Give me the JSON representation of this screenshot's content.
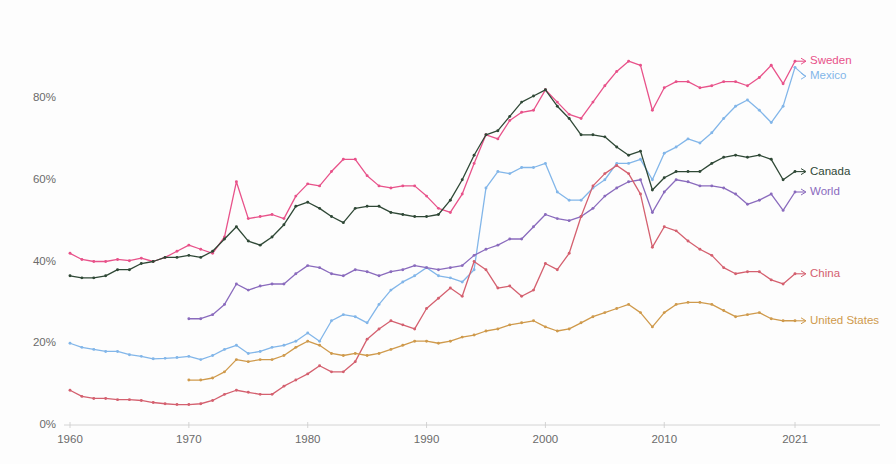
{
  "chart_data": {
    "type": "line",
    "title": "",
    "subtitle": "",
    "xlabel": "",
    "ylabel": "",
    "xlim": [
      1960,
      2021
    ],
    "ylim": [
      0,
      90
    ],
    "grid": false,
    "legend_position": "right-inline-labels",
    "y_ticks": [
      "0%",
      "20%",
      "40%",
      "60%",
      "80%"
    ],
    "y_tick_values": [
      0,
      20,
      40,
      60,
      80
    ],
    "x_ticks": [
      "1960",
      "1970",
      "1980",
      "1990",
      "2000",
      "2010",
      "2021"
    ],
    "x_tick_values": [
      1960,
      1970,
      1980,
      1990,
      2000,
      2010,
      2021
    ],
    "series": [
      {
        "name": "Sweden",
        "color": "#e8528a",
        "label_color": "#e8528a",
        "start_year": 1960,
        "values": [
          42.0,
          40.5,
          40.0,
          40.0,
          40.5,
          40.2,
          40.8,
          40.0,
          41.0,
          42.5,
          44.0,
          43.0,
          42.0,
          46.0,
          59.5,
          50.5,
          51.0,
          51.5,
          50.5,
          56.0,
          59.0,
          58.5,
          62.0,
          65.0,
          65.0,
          61.0,
          58.5,
          58.0,
          58.5,
          58.5,
          56.0,
          53.0,
          52.0,
          56.5,
          64.0,
          71.0,
          70.0,
          74.5,
          76.5,
          77.0,
          82.0,
          79.0,
          76.0,
          75.0,
          79.0,
          83.0,
          86.5,
          89.0,
          88.0,
          77.0,
          82.5,
          84.0,
          84.0,
          82.5,
          83.0,
          84.0,
          84.0,
          83.0,
          85.0,
          88.0,
          83.5,
          89.0
        ]
      },
      {
        "name": "Mexico",
        "color": "#82b6e9",
        "label_color": "#82b6e9",
        "start_year": 1960,
        "values": [
          20.0,
          19.0,
          18.5,
          18.0,
          18.0,
          17.2,
          16.8,
          16.2,
          16.3,
          16.5,
          16.8,
          16.0,
          17.0,
          18.5,
          19.5,
          17.5,
          18.0,
          19.0,
          19.5,
          20.5,
          22.5,
          20.5,
          25.5,
          27.0,
          26.5,
          25.0,
          29.5,
          33.0,
          35.0,
          36.5,
          38.5,
          36.5,
          36.0,
          35.0,
          38.0,
          58.0,
          62.0,
          61.5,
          63.0,
          63.0,
          64.0,
          57.0,
          55.0,
          55.0,
          58.0,
          60.0,
          64.0,
          64.0,
          65.0,
          60.0,
          66.5,
          68.0,
          70.0,
          69.0,
          71.5,
          75.0,
          78.0,
          79.5,
          77.0,
          74.0,
          78.0,
          87.5
        ]
      },
      {
        "name": "Canada",
        "color": "#2f4836",
        "label_color": "#2f4836",
        "start_year": 1960,
        "values": [
          36.5,
          36.0,
          36.0,
          36.5,
          38.0,
          38.0,
          39.5,
          40.0,
          41.0,
          41.0,
          41.5,
          41.0,
          42.5,
          45.5,
          48.5,
          45.0,
          44.0,
          46.0,
          49.0,
          53.5,
          54.5,
          53.0,
          51.0,
          49.5,
          53.0,
          53.5,
          53.5,
          52.0,
          51.5,
          51.0,
          51.0,
          51.5,
          55.0,
          60.0,
          66.0,
          71.0,
          72.0,
          75.5,
          79.0,
          80.5,
          82.0,
          78.0,
          75.0,
          71.0,
          71.0,
          70.5,
          68.0,
          66.0,
          67.0,
          57.5,
          60.5,
          62.0,
          62.0,
          62.0,
          64.0,
          65.5,
          66.0,
          65.5,
          66.0,
          65.0,
          60.0,
          62.0
        ]
      },
      {
        "name": "World",
        "color": "#8a6bbd",
        "label_color": "#8a6bbd",
        "start_year": 1970,
        "values": [
          26.0,
          26.0,
          27.0,
          29.5,
          34.5,
          33.0,
          34.0,
          34.5,
          34.5,
          37.0,
          39.0,
          38.5,
          37.0,
          36.5,
          38.0,
          37.5,
          36.5,
          37.5,
          38.0,
          39.0,
          38.5,
          38.0,
          38.5,
          39.0,
          41.5,
          43.0,
          44.0,
          45.5,
          45.5,
          48.5,
          51.5,
          50.5,
          50.0,
          51.0,
          53.0,
          56.0,
          58.0,
          59.5,
          60.0,
          52.0,
          57.0,
          60.0,
          59.5,
          58.5,
          58.5,
          58.0,
          56.5,
          54.0,
          55.0,
          56.5,
          52.5,
          57.0
        ]
      },
      {
        "name": "China",
        "color": "#d4606f",
        "label_color": "#d4606f",
        "start_year": 1960,
        "values": [
          8.5,
          7.0,
          6.5,
          6.5,
          6.2,
          6.2,
          6.0,
          5.5,
          5.2,
          5.0,
          5.0,
          5.2,
          6.0,
          7.5,
          8.5,
          8.0,
          7.5,
          7.5,
          9.5,
          11.0,
          12.5,
          14.5,
          13.0,
          13.0,
          15.5,
          21.0,
          23.5,
          25.5,
          24.5,
          23.5,
          28.5,
          31.0,
          33.5,
          31.5,
          40.0,
          38.0,
          33.5,
          34.0,
          31.5,
          33.0,
          39.5,
          38.0,
          42.0,
          51.0,
          58.5,
          61.5,
          63.5,
          61.5,
          56.5,
          43.5,
          48.5,
          47.5,
          45.0,
          43.0,
          41.5,
          38.5,
          37.0,
          37.5,
          37.5,
          35.5,
          34.5,
          37.0
        ]
      },
      {
        "name": "United States",
        "color": "#cf9a4c",
        "label_color": "#cf9a4c",
        "start_year": 1970,
        "values": [
          11.0,
          11.0,
          11.5,
          13.0,
          16.0,
          15.5,
          16.0,
          16.0,
          17.0,
          19.0,
          20.5,
          19.5,
          17.5,
          17.0,
          17.5,
          17.0,
          17.5,
          18.5,
          19.5,
          20.5,
          20.5,
          20.0,
          20.5,
          21.5,
          22.0,
          23.0,
          23.5,
          24.5,
          25.0,
          25.5,
          24.0,
          23.0,
          23.5,
          25.0,
          26.5,
          27.5,
          28.5,
          29.5,
          27.5,
          24.0,
          27.5,
          29.5,
          30.0,
          30.0,
          29.5,
          28.0,
          26.5,
          27.0,
          27.5,
          26.0,
          25.5,
          25.5
        ]
      }
    ]
  }
}
